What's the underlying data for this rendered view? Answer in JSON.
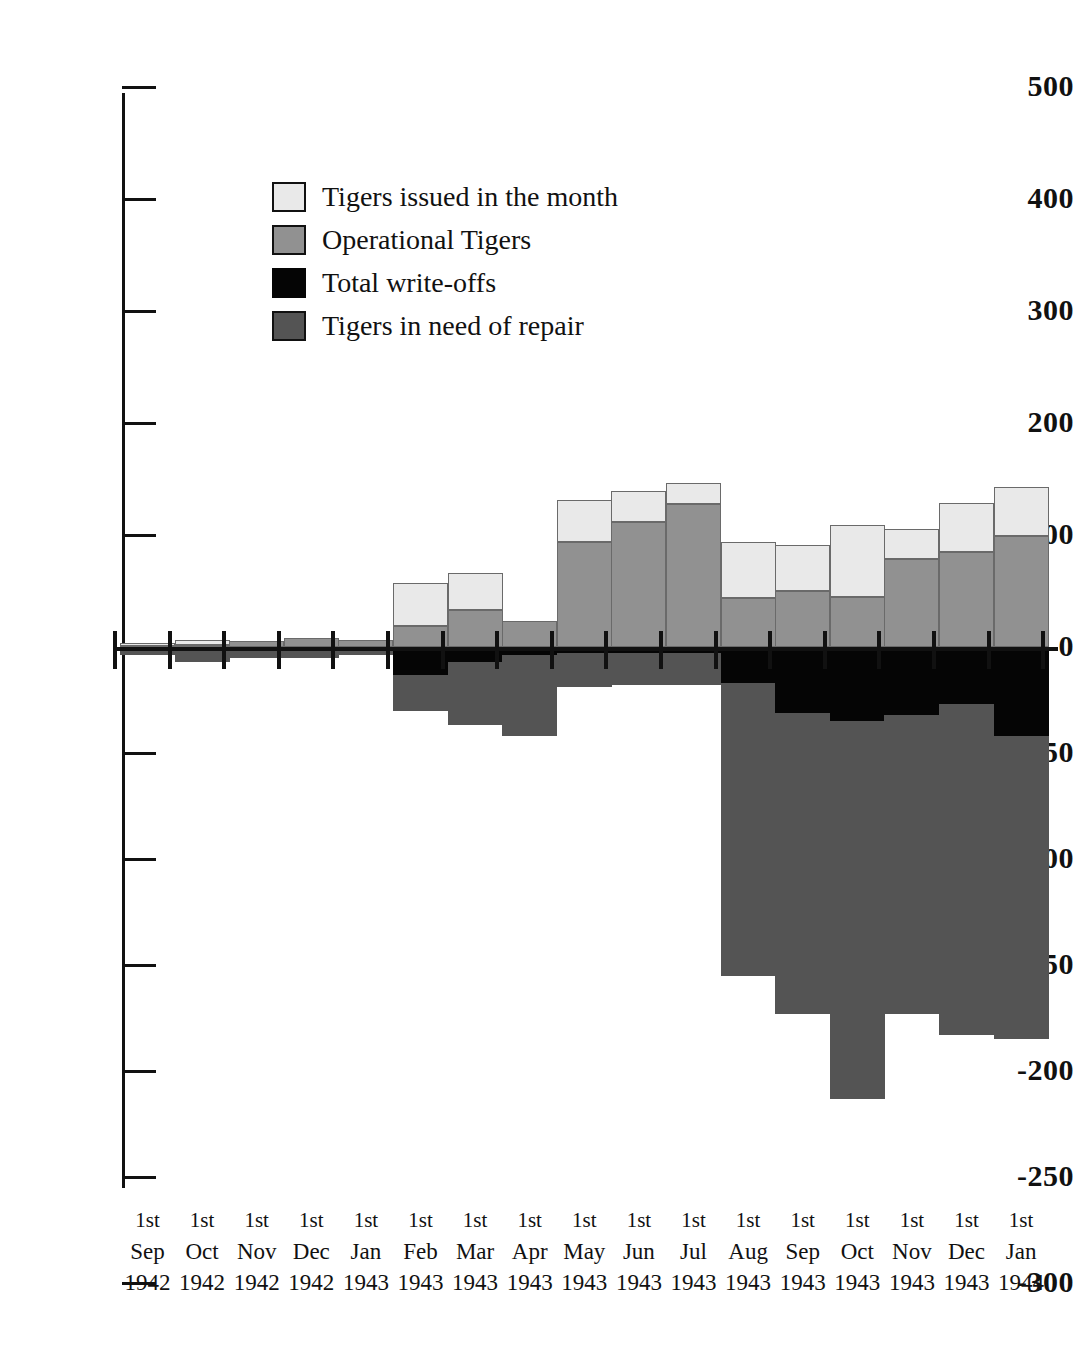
{
  "chart_data": {
    "type": "bar",
    "title": "",
    "subtitle": "",
    "xlabel": "",
    "ylabel": "",
    "grid": false,
    "stacked": true,
    "legend_position": "inside-top-left",
    "axis_note": "Positive axis ticks every 100; negative axis ticks every 50 (negative half drawn at 2x vertical scale)",
    "y_ticks_positive": [
      500,
      400,
      300,
      200,
      100,
      0
    ],
    "y_ticks_negative": [
      -50,
      -100,
      -150,
      -200,
      -250,
      -300
    ],
    "y_tick_labels": [
      "500",
      "400",
      "300",
      "200",
      "100",
      "0",
      "-50",
      "-100",
      "-150",
      "-200",
      "-250",
      "-300"
    ],
    "ylim": [
      -300,
      500
    ],
    "categories": [
      {
        "day": "1st",
        "month": "Sep",
        "year": "1942"
      },
      {
        "day": "1st",
        "month": "Oct",
        "year": "1942"
      },
      {
        "day": "1st",
        "month": "Nov",
        "year": "1942"
      },
      {
        "day": "1st",
        "month": "Dec",
        "year": "1942"
      },
      {
        "day": "1st",
        "month": "Jan",
        "year": "1943"
      },
      {
        "day": "1st",
        "month": "Feb",
        "year": "1943"
      },
      {
        "day": "1st",
        "month": "Mar",
        "year": "1943"
      },
      {
        "day": "1st",
        "month": "Apr",
        "year": "1943"
      },
      {
        "day": "1st",
        "month": "May",
        "year": "1943"
      },
      {
        "day": "1st",
        "month": "Jun",
        "year": "1943"
      },
      {
        "day": "1st",
        "month": "Jul",
        "year": "1943"
      },
      {
        "day": "1st",
        "month": "Aug",
        "year": "1943"
      },
      {
        "day": "1st",
        "month": "Sep",
        "year": "1943"
      },
      {
        "day": "1st",
        "month": "Oct",
        "year": "1943"
      },
      {
        "day": "1st",
        "month": "Nov",
        "year": "1943"
      },
      {
        "day": "1st",
        "month": "Dec",
        "year": "1943"
      },
      {
        "day": "1st",
        "month": "Jan",
        "year": "1944"
      }
    ],
    "series": [
      {
        "name": "Tigers issued in the month",
        "color": "#e9e9e9",
        "values": [
          3,
          4,
          0,
          0,
          0,
          38,
          33,
          0,
          37,
          27,
          18,
          50,
          41,
          64,
          26,
          44,
          44
        ]
      },
      {
        "name": "Operational Tigers",
        "color": "#919191",
        "values": [
          1,
          2,
          5,
          8,
          6,
          19,
          33,
          23,
          94,
          112,
          128,
          44,
          50,
          45,
          79,
          85,
          99
        ]
      },
      {
        "name": "Total write-offs",
        "color": "#050505",
        "values": [
          -1,
          -2,
          -1,
          -1,
          -1,
          -13,
          -7,
          -4,
          -3,
          -3,
          -3,
          -17,
          -31,
          -35,
          -32,
          -27,
          -42
        ]
      },
      {
        "name": "Tigers in need of repair",
        "color": "#545454",
        "values": [
          -3,
          -5,
          -4,
          -4,
          -3,
          -17,
          -30,
          -38,
          -16,
          -15,
          -15,
          -138,
          -142,
          -178,
          -141,
          -156,
          -143
        ]
      }
    ]
  },
  "legend": {
    "items": [
      {
        "label": "Tigers issued in the month",
        "swatch": "light-gray"
      },
      {
        "label": "Operational Tigers",
        "swatch": "medium-gray"
      },
      {
        "label": "Total write-offs",
        "swatch": "black"
      },
      {
        "label": "Tigers in need of repair",
        "swatch": "dark-gray"
      }
    ]
  },
  "colors": {
    "issued": "#e9e9e9",
    "operational": "#919191",
    "writeoff": "#050505",
    "repair": "#545454",
    "axis": "#111111",
    "background": "#ffffff"
  }
}
